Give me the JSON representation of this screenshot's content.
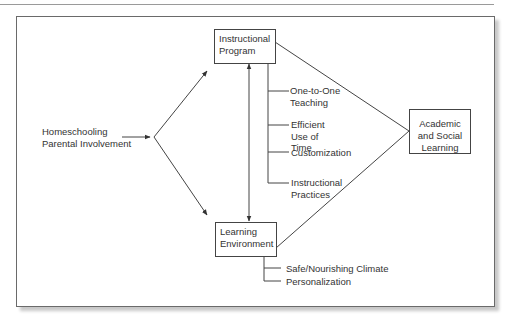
{
  "diagram": {
    "type": "conceptual-model",
    "source": {
      "label": "Homeschooling\nParental Involvement"
    },
    "nodes": {
      "instructional_program": {
        "label": "Instructional\nProgram"
      },
      "learning_environment": {
        "label": "Learning\nEnvironment"
      },
      "outcome": {
        "label": "Academic\nand Social\nLearning"
      }
    },
    "instructional_program_components": [
      {
        "label": "One-to-One\nTeaching"
      },
      {
        "label": "Efficient\nUse of\nTime"
      },
      {
        "label": "Customization"
      },
      {
        "label": "Instructional\nPractices"
      }
    ],
    "learning_environment_components": [
      {
        "label": "Safe/Nourishing Climate"
      },
      {
        "label": "Personalization"
      }
    ],
    "colors": {
      "line": "#444444",
      "text": "#333333",
      "frame": "#6a6a6a"
    }
  }
}
